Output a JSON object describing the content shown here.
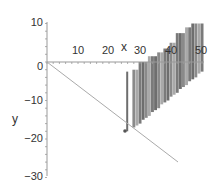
{
  "chart_data": {
    "type": "line",
    "title": "",
    "xlabel": "x",
    "ylabel": "y",
    "xlim": [
      0,
      50
    ],
    "ylim": [
      -30,
      10
    ],
    "grid": false,
    "legend": null,
    "x_ticks": [
      "10",
      "20",
      "30",
      "40",
      "50"
    ],
    "y_ticks": [
      "10",
      "0",
      "-10",
      "-20",
      "-30"
    ],
    "series": [
      {
        "name": "line",
        "style": "thin gray line",
        "x": [
          0,
          25,
          42
        ],
        "y": [
          0,
          -18.5,
          -31.5
        ]
      },
      {
        "name": "point",
        "style": "dark dot",
        "x": [
          25
        ],
        "y": [
          -18.5
        ]
      },
      {
        "name": "bars",
        "style": "gray vertical bars (staircase)",
        "x": [
          26,
          28,
          29,
          30,
          31,
          32,
          33,
          34,
          35,
          36,
          37,
          38,
          39,
          40,
          41,
          42,
          43,
          44,
          45,
          46,
          47,
          48,
          49,
          50
        ],
        "top": [
          -2.5,
          -2,
          -2,
          0,
          0,
          0,
          1.5,
          1.5,
          1.5,
          2.5,
          2.5,
          3.5,
          3.5,
          5,
          5,
          7.5,
          7.5,
          7.5,
          9,
          9,
          10,
          10,
          10,
          10
        ],
        "bottom": [
          -18,
          -17,
          -16.5,
          -16,
          -15,
          -14.5,
          -14,
          -13,
          -12.5,
          -12,
          -11,
          -10.5,
          -10,
          -9,
          -8.5,
          -8,
          -7,
          -6.5,
          -6,
          -5,
          -4.5,
          -4,
          -3,
          -2.5
        ]
      }
    ]
  },
  "axes": {
    "x_label": "x",
    "y_label": "y",
    "x_ticks": [
      {
        "label": "10",
        "value": 10
      },
      {
        "label": "20",
        "value": 20
      },
      {
        "label": "30",
        "value": 30
      },
      {
        "label": "40",
        "value": 40
      },
      {
        "label": "50",
        "value": 50
      }
    ],
    "y_ticks": [
      {
        "label": "10",
        "value": 10
      },
      {
        "label": "0",
        "value": 0
      },
      {
        "label": "−10",
        "value": -10
      },
      {
        "label": "−20",
        "value": -20
      },
      {
        "label": "−30",
        "value": -30
      }
    ]
  }
}
